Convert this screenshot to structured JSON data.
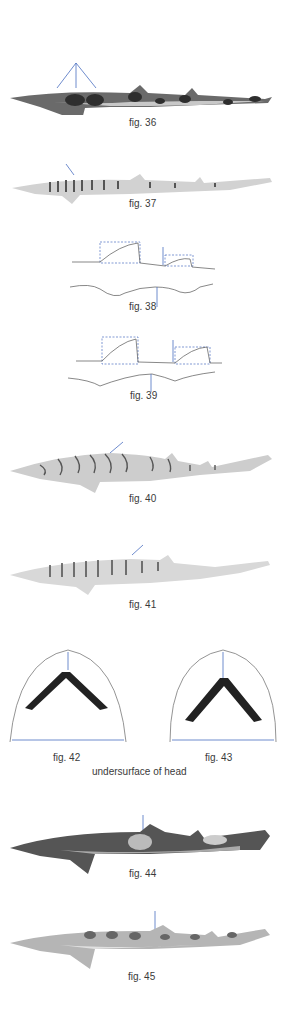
{
  "figures": [
    {
      "id": "fig36",
      "caption": "fig. 36",
      "subject": "shark with dark saddle blotches, three arrows pointing to saddles"
    },
    {
      "id": "fig37",
      "caption": "fig. 37",
      "subject": "slender shark with narrow dark bars, arrow at anterior bars"
    },
    {
      "id": "fig38",
      "caption": "fig. 38",
      "subject": "fin outline diagram, dorsal fins boxed, arrows"
    },
    {
      "id": "fig39",
      "caption": "fig. 39",
      "subject": "fin outline diagram, dorsal fins boxed, arrows"
    },
    {
      "id": "fig40",
      "caption": "fig. 40",
      "subject": "shark with dark-edged irregular bands, arrow"
    },
    {
      "id": "fig41",
      "caption": "fig. 41",
      "subject": "slender shark with dark vertical bars, arrow"
    },
    {
      "id": "fig42",
      "caption": "fig. 42",
      "subject": "undersurface of head, narrow mouth"
    },
    {
      "id": "fig43",
      "caption": "fig. 43",
      "subject": "undersurface of head, broad mouth"
    },
    {
      "id": "fig44",
      "caption": "fig. 44",
      "subject": "dark blotched shark, arrow at first dorsal fin"
    },
    {
      "id": "fig45",
      "caption": "fig. 45",
      "subject": "light shark with dark saddles, arrow at first dorsal fin"
    }
  ],
  "group_caption": "undersurface of head",
  "colors": {
    "arrow": "#4a6fc0",
    "outline": "#555555",
    "text": "#3a3a3a"
  }
}
